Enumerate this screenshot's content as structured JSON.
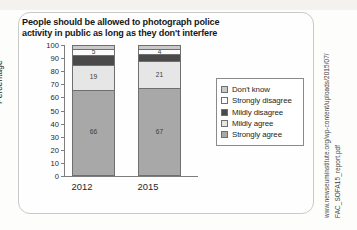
{
  "chart_data": {
    "type": "bar",
    "subtype": "stacked-bar-100",
    "title": "People should be allowed to photograph police activity in public as long as they don't interfere",
    "xlabel": "",
    "ylabel": "Percentage",
    "ylim": [
      0,
      100
    ],
    "yticks": [
      100,
      90,
      80,
      70,
      60,
      50,
      40,
      30,
      20,
      10,
      0
    ],
    "grid": false,
    "legend_position": "right",
    "categories": [
      "2012",
      "2015"
    ],
    "series": [
      {
        "name": "Strongly agree",
        "values": [
          66,
          67
        ],
        "color": "#a8a8a8"
      },
      {
        "name": "Mildly agree",
        "values": [
          19,
          21
        ],
        "color": "#e6e6e6"
      },
      {
        "name": "Mildly disagree",
        "values": [
          7,
          5
        ],
        "color": "#4a4a4a"
      },
      {
        "name": "Strongly disagree",
        "values": [
          5,
          4
        ],
        "color": "#fcfcfc"
      },
      {
        "name": "Don't know",
        "values": [
          3,
          3
        ],
        "color": "#c9c9c9"
      }
    ]
  },
  "source": {
    "url": "www.newseuminstitute.org/wp-content/uploads/2015/07/",
    "file": "FAC_SOFA15_report.pdf"
  }
}
